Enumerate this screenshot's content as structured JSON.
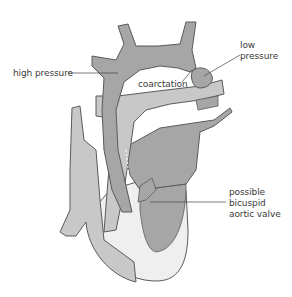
{
  "diagram": {
    "labels": {
      "high_pressure": "high pressure",
      "low_pressure_line1": "low",
      "low_pressure_line2": "pressure",
      "coarctation": "coarctation",
      "valve_line1": "possible",
      "valve_line2": "bicuspid",
      "valve_line3": "aortic valve"
    },
    "colors": {
      "dark_tissue": "#a6a6a6",
      "mid_tissue": "#bdbdbd",
      "light_tissue": "#c8c8c8",
      "pale_tissue": "#efefef",
      "outline": "#5a5a5a",
      "text": "#3a3a3a"
    }
  }
}
